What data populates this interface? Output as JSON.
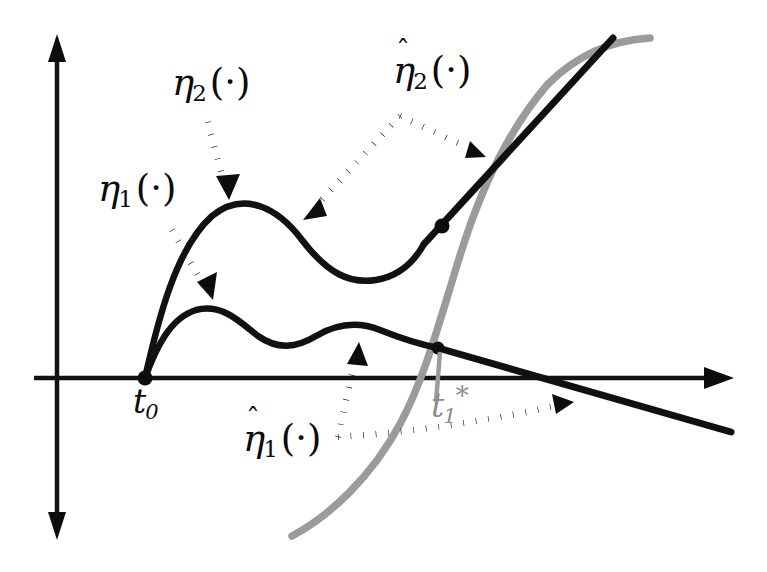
{
  "figure": {
    "kind": "annotated-function-diagram",
    "background_color": "#ffffff",
    "labels": {
      "eta1": {
        "base": "η",
        "subscript": "1",
        "argument": "(·)",
        "hat": false,
        "color": "#0b0b0b"
      },
      "eta2": {
        "base": "η",
        "subscript": "2",
        "argument": "(·)",
        "hat": false,
        "color": "#0b0b0b"
      },
      "eta1_hat": {
        "base": "η",
        "subscript": "1",
        "argument": "(·)",
        "hat": true,
        "hat_glyph": "ˆ",
        "color": "#0b0b0b"
      },
      "eta2_hat": {
        "base": "η",
        "subscript": "2",
        "argument": "(·)",
        "hat": true,
        "hat_glyph": "ˆ",
        "color": "#0b0b0b"
      },
      "t0": {
        "base": "t",
        "subscript": "0",
        "superscript": "",
        "color": "#0b0b0b"
      },
      "t1_star": {
        "base": "t",
        "subscript": "1",
        "superscript": "*",
        "color": "#8d8d8d"
      }
    },
    "axes": {
      "origin": {
        "x": 145,
        "y": 378
      },
      "vertical": {
        "x": 57,
        "y_top": 40,
        "y_bottom": 532,
        "double_headed": true,
        "color": "#121212"
      },
      "horizontal": {
        "y": 378,
        "x_left": 34,
        "x_right": 731,
        "arrow_right": true,
        "color": "#121212"
      }
    },
    "curves": {
      "eta2": {
        "description": "upper black curve: rises steeply from origin, peaks, dips, then rises as a straight ray",
        "color": "#111111",
        "stroke_width": 6.5,
        "points": [
          [
            145,
            378
          ],
          [
            160,
            330
          ],
          [
            178,
            276
          ],
          [
            198,
            236
          ],
          [
            222,
            212
          ],
          [
            248,
            206
          ],
          [
            278,
            219
          ],
          [
            306,
            243
          ],
          [
            334,
            268
          ],
          [
            362,
            281
          ],
          [
            388,
            277
          ],
          [
            412,
            258
          ],
          [
            613,
            38
          ]
        ]
      },
      "eta1": {
        "description": "lower black curve: rises from origin, small peak, dip, second small peak, then descends as a straight line",
        "color": "#111111",
        "stroke_width": 6.5,
        "points": [
          [
            145,
            378
          ],
          [
            160,
            350
          ],
          [
            176,
            327
          ],
          [
            196,
            311
          ],
          [
            216,
            309
          ],
          [
            238,
            318
          ],
          [
            262,
            334
          ],
          [
            288,
            344
          ],
          [
            314,
            338
          ],
          [
            340,
            328
          ],
          [
            366,
            325
          ],
          [
            392,
            330
          ],
          [
            418,
            341
          ],
          [
            455,
            353
          ],
          [
            731,
            432
          ]
        ]
      },
      "gray": {
        "description": "thick gray sigmoid curve crossing the axis near t1*",
        "color": "#9b9b9b",
        "stroke_width": 7.5,
        "points": [
          [
            292,
            536
          ],
          [
            318,
            520
          ],
          [
            350,
            494
          ],
          [
            382,
            456
          ],
          [
            408,
            412
          ],
          [
            428,
            368
          ],
          [
            444,
            318
          ],
          [
            460,
            258
          ],
          [
            482,
            190
          ],
          [
            512,
            126
          ],
          [
            550,
            80
          ],
          [
            598,
            50
          ],
          [
            650,
            38
          ]
        ]
      }
    },
    "markers": {
      "origin_dot": {
        "x": 145,
        "y": 378,
        "r": 7,
        "color": "#0d0d0d"
      },
      "eta2_dot": {
        "x": 442,
        "y": 226,
        "r": 7,
        "color": "#0d0d0d"
      },
      "eta1_dot": {
        "x": 438,
        "y": 348,
        "r": 6,
        "color": "#0d0d0d"
      },
      "t1_tick": {
        "x": 438,
        "y_top": 355,
        "y_bottom": 400,
        "color": "#9b9b9b"
      }
    },
    "leaders": [
      {
        "name": "eta2-leader",
        "from": [
          208,
          120
        ],
        "to": [
          228,
          196
        ],
        "style": "dotted",
        "arrow": "end"
      },
      {
        "name": "eta1-leader",
        "from": [
          172,
          230
        ],
        "to": [
          211,
          295
        ],
        "style": "dotted",
        "arrow": "end"
      },
      {
        "name": "eta2hat-leader-left",
        "from": [
          400,
          115
        ],
        "to": [
          308,
          215
        ],
        "style": "dotted",
        "arrow": "end"
      },
      {
        "name": "eta2hat-leader-right",
        "from": [
          400,
          115
        ],
        "to": [
          480,
          153
        ],
        "style": "dotted",
        "arrow": "end"
      },
      {
        "name": "eta1hat-leader-up",
        "from": [
          338,
          437
        ],
        "to": [
          359,
          345
        ],
        "style": "dotted",
        "arrow": "end"
      },
      {
        "name": "eta1hat-leader-right",
        "from": [
          338,
          437
        ],
        "to": [
          572,
          404
        ],
        "style": "dotted",
        "arrow": "end"
      }
    ]
  }
}
